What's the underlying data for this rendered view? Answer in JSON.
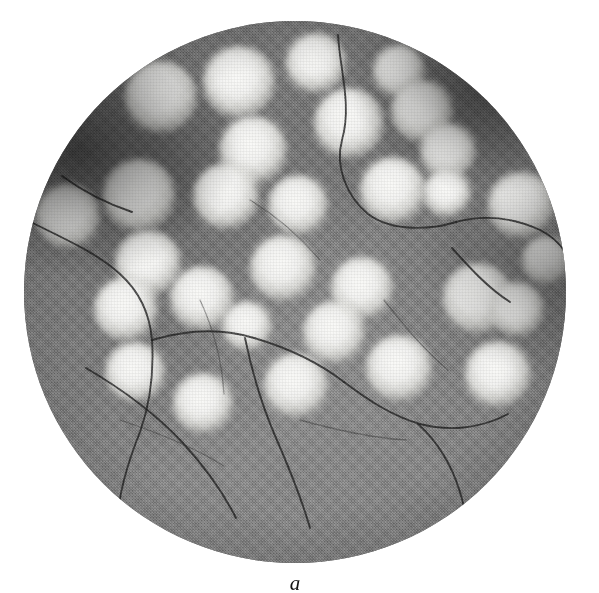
{
  "figure": {
    "caption": "a",
    "caption_style": "italic-serif-lowercase",
    "panel_label": "a",
    "kind": "photomicrograph",
    "field_shape": "circle",
    "page_background": "#ffffff"
  },
  "micrograph": {
    "background_color": "#808080",
    "highlight_color": "#f8f8f6",
    "shadow_color": "#1a1a1a",
    "field": {
      "cx": 295,
      "cy": 292,
      "r": 271
    },
    "texture": "halftone-print-grain",
    "vignette": "dark rim, strongest upper-left and upper-right",
    "particles": [
      {
        "cx": 161,
        "cy": 97,
        "r": 36
      },
      {
        "cx": 239,
        "cy": 82,
        "r": 36
      },
      {
        "cx": 253,
        "cy": 150,
        "r": 34
      },
      {
        "cx": 316,
        "cy": 63,
        "r": 30
      },
      {
        "cx": 349,
        "cy": 123,
        "r": 35
      },
      {
        "cx": 399,
        "cy": 71,
        "r": 26
      },
      {
        "cx": 422,
        "cy": 111,
        "r": 31
      },
      {
        "cx": 448,
        "cy": 151,
        "r": 28
      },
      {
        "cx": 68,
        "cy": 216,
        "r": 32
      },
      {
        "cx": 139,
        "cy": 195,
        "r": 36
      },
      {
        "cx": 226,
        "cy": 196,
        "r": 33
      },
      {
        "cx": 298,
        "cy": 205,
        "r": 30
      },
      {
        "cx": 393,
        "cy": 190,
        "r": 33
      },
      {
        "cx": 447,
        "cy": 193,
        "r": 24
      },
      {
        "cx": 521,
        "cy": 205,
        "r": 33
      },
      {
        "cx": 546,
        "cy": 260,
        "r": 24
      },
      {
        "cx": 148,
        "cy": 263,
        "r": 33
      },
      {
        "cx": 283,
        "cy": 268,
        "r": 33
      },
      {
        "cx": 202,
        "cy": 298,
        "r": 32
      },
      {
        "cx": 362,
        "cy": 288,
        "r": 31
      },
      {
        "cx": 126,
        "cy": 309,
        "r": 32
      },
      {
        "cx": 247,
        "cy": 326,
        "r": 25
      },
      {
        "cx": 334,
        "cy": 332,
        "r": 31
      },
      {
        "cx": 478,
        "cy": 298,
        "r": 35
      },
      {
        "cx": 517,
        "cy": 309,
        "r": 27
      },
      {
        "cx": 135,
        "cy": 372,
        "r": 30
      },
      {
        "cx": 203,
        "cy": 403,
        "r": 30
      },
      {
        "cx": 296,
        "cy": 385,
        "r": 32
      },
      {
        "cx": 399,
        "cy": 368,
        "r": 33
      },
      {
        "cx": 498,
        "cy": 374,
        "r": 33
      }
    ],
    "cracks": [
      "M 338,35 C 340,70 352,105 342,140 C 335,166 346,196 368,214 C 392,232 430,230 456,222",
      "M 456,222 C 486,214 514,218 540,230 C 552,236 560,244 565,252",
      "M 31,222 C 62,238 96,252 120,274 C 140,292 150,316 152,340",
      "M 152,340 C 154,372 150,404 140,432 C 128,462 120,490 118,514",
      "M 152,340 C 186,330 222,328 254,338 C 288,348 318,362 344,382",
      "M 344,382 C 368,400 392,416 420,424 C 450,432 482,428 508,414",
      "M 245,338 C 252,372 262,406 276,438 C 290,470 302,500 310,528",
      "M 418,424 C 438,442 452,466 460,492 C 466,512 468,528 468,540",
      "M 86,368 C 120,388 154,412 182,442 C 206,468 224,494 236,518",
      "M 452,248 C 470,268 488,288 510,302",
      "M 62,176 C 84,192 108,204 132,212"
    ],
    "cracks_faint": [
      "M 200,300 C 214,330 222,362 224,394",
      "M 300,420 C 336,430 372,438 406,440",
      "M 120,420 C 156,432 192,446 224,466",
      "M 384,300 C 404,326 424,350 448,370",
      "M 250,200 C 276,216 300,236 320,260"
    ]
  }
}
